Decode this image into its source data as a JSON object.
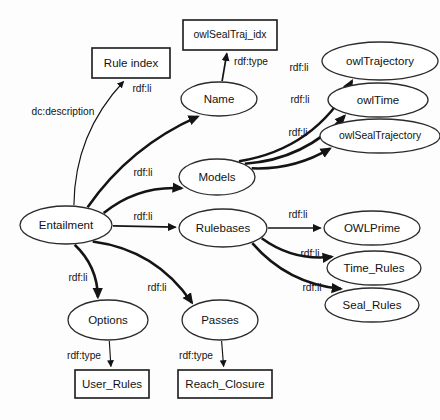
{
  "diagram": {
    "background_color": "#fdfdfd",
    "stroke_color": "#141414",
    "nodes": [
      {
        "id": "rule_index",
        "label": "Rule index",
        "shape": "rect",
        "cx": 131,
        "cy": 63,
        "rx": 39,
        "ry": 15
      },
      {
        "id": "owl_seal_traj_idx",
        "label": "owlSealTraj_idx",
        "shape": "rect",
        "cx": 230,
        "cy": 35,
        "rx": 47,
        "ry": 15
      },
      {
        "id": "name",
        "label": "Name",
        "shape": "ellipse",
        "cx": 219,
        "cy": 99,
        "rx": 38,
        "ry": 17
      },
      {
        "id": "owl_trajectory",
        "label": "owlTrajectory",
        "shape": "ellipse",
        "cx": 380,
        "cy": 61,
        "rx": 58,
        "ry": 19
      },
      {
        "id": "owl_time",
        "label": "owlTime",
        "shape": "ellipse",
        "cx": 378,
        "cy": 100,
        "rx": 50,
        "ry": 17
      },
      {
        "id": "owl_seal_trajectory",
        "label": "owlSealTrajectory",
        "shape": "ellipse",
        "cx": 380,
        "cy": 136,
        "rx": 60,
        "ry": 17
      },
      {
        "id": "models",
        "label": "Models",
        "shape": "ellipse",
        "cx": 217,
        "cy": 177,
        "rx": 38,
        "ry": 18
      },
      {
        "id": "rulebases",
        "label": "Rulebases",
        "shape": "ellipse",
        "cx": 223,
        "cy": 228,
        "rx": 44,
        "ry": 19
      },
      {
        "id": "entailment",
        "label": "Entailment",
        "shape": "ellipse",
        "cx": 66,
        "cy": 225,
        "rx": 46,
        "ry": 19
      },
      {
        "id": "owl_prime",
        "label": "OWLPrime",
        "shape": "ellipse",
        "cx": 372,
        "cy": 228,
        "rx": 48,
        "ry": 17
      },
      {
        "id": "time_rules",
        "label": "Time_Rules",
        "shape": "ellipse",
        "cx": 374,
        "cy": 268,
        "rx": 47,
        "ry": 17
      },
      {
        "id": "seal_rules",
        "label": "Seal_Rules",
        "shape": "ellipse",
        "cx": 372,
        "cy": 305,
        "rx": 47,
        "ry": 17
      },
      {
        "id": "options",
        "label": "Options",
        "shape": "ellipse",
        "cx": 108,
        "cy": 320,
        "rx": 40,
        "ry": 20
      },
      {
        "id": "passes",
        "label": "Passes",
        "shape": "ellipse",
        "cx": 220,
        "cy": 320,
        "rx": 38,
        "ry": 20
      },
      {
        "id": "user_rules",
        "label": "User_Rules",
        "shape": "rect",
        "cx": 112,
        "cy": 384,
        "rx": 37,
        "ry": 14
      },
      {
        "id": "reach_closure",
        "label": "Reach_Closure",
        "shape": "rect",
        "cx": 225,
        "cy": 384,
        "rx": 47,
        "ry": 14
      }
    ],
    "edges": [
      {
        "id": "e1",
        "from": "entailment",
        "to": "rule_index",
        "label": "dc:description",
        "label_x": 63,
        "label_y": 112,
        "weight": "thin"
      },
      {
        "id": "e2",
        "from": "entailment",
        "to": "name",
        "label": "rdf:li",
        "label_x": 142,
        "label_y": 89,
        "weight": "thick"
      },
      {
        "id": "e3",
        "from": "name",
        "to": "owl_seal_traj_idx",
        "label": "rdf:type",
        "label_x": 251,
        "label_y": 62,
        "weight": "med"
      },
      {
        "id": "e4",
        "from": "entailment",
        "to": "models",
        "label": "rdf:li",
        "label_x": 143,
        "label_y": 173,
        "weight": "thick"
      },
      {
        "id": "e5",
        "from": "models",
        "to": "owl_trajectory",
        "label": "rdf:li",
        "label_x": 299,
        "label_y": 68,
        "weight": "thick"
      },
      {
        "id": "e6",
        "from": "models",
        "to": "owl_time",
        "label": "rdf:li",
        "label_x": 300,
        "label_y": 100,
        "weight": "thick"
      },
      {
        "id": "e7",
        "from": "models",
        "to": "owl_seal_trajectory",
        "label": "rdf:li",
        "label_x": 298,
        "label_y": 133,
        "weight": "thick"
      },
      {
        "id": "e8",
        "from": "entailment",
        "to": "rulebases",
        "label": "rdf:li",
        "label_x": 143,
        "label_y": 217,
        "weight": "med"
      },
      {
        "id": "e9",
        "from": "rulebases",
        "to": "owl_prime",
        "label": "rdf:li",
        "label_x": 298,
        "label_y": 215,
        "weight": "med"
      },
      {
        "id": "e10",
        "from": "rulebases",
        "to": "time_rules",
        "label": "rdf:li",
        "label_x": 310,
        "label_y": 254,
        "weight": "thick"
      },
      {
        "id": "e11",
        "from": "rulebases",
        "to": "seal_rules",
        "label": "rdf:li",
        "label_x": 312,
        "label_y": 288,
        "weight": "thick"
      },
      {
        "id": "e12",
        "from": "entailment",
        "to": "options",
        "label": "rdf:li",
        "label_x": 78,
        "label_y": 278,
        "weight": "thick"
      },
      {
        "id": "e13",
        "from": "entailment",
        "to": "passes",
        "label": "rdf:li",
        "label_x": 157,
        "label_y": 288,
        "weight": "thick"
      },
      {
        "id": "e14",
        "from": "options",
        "to": "user_rules",
        "label": "rdf:type",
        "label_x": 84,
        "label_y": 356,
        "weight": "thin"
      },
      {
        "id": "e15",
        "from": "passes",
        "to": "reach_closure",
        "label": "rdf:type",
        "label_x": 196,
        "label_y": 356,
        "weight": "thin"
      }
    ]
  }
}
